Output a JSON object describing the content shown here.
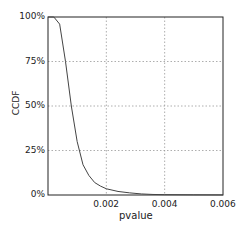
{
  "chart_data": {
    "type": "line",
    "title": "",
    "xlabel": "pvalue",
    "ylabel": "CCDF",
    "xlim": [
      0,
      0.006
    ],
    "ylim": [
      0,
      100
    ],
    "x_ticks": [
      "0.002",
      "0.004",
      "0.006"
    ],
    "y_ticks": [
      "0%",
      "25%",
      "50%",
      "75%",
      "100%"
    ],
    "grid": true,
    "legend": null,
    "series": [
      {
        "name": "CCDF",
        "x": [
          0.0,
          0.0002,
          0.0004,
          0.0006,
          0.0008,
          0.001,
          0.0012,
          0.0014,
          0.0016,
          0.0018,
          0.002,
          0.0024,
          0.0028,
          0.0032,
          0.0036,
          0.004,
          0.005,
          0.006
        ],
        "values": [
          100,
          100,
          96,
          75,
          50,
          30,
          17,
          11,
          7,
          5,
          3.5,
          2,
          1.2,
          0.6,
          0.3,
          0.2,
          0.1,
          0.05
        ]
      }
    ]
  }
}
